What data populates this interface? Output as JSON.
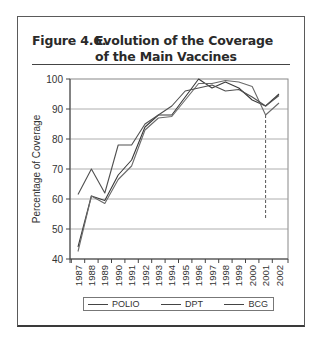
{
  "figure": {
    "number_label": "Figure 4.6.",
    "title_line1": "Evolution of the Coverage",
    "title_line2": "of the Main Vaccines"
  },
  "chart_data": {
    "type": "line",
    "xlabel": "",
    "ylabel": "Percentage of Coverage",
    "ylim": [
      40,
      100
    ],
    "yticks": [
      40,
      50,
      60,
      70,
      80,
      90,
      100
    ],
    "grid": true,
    "legend_position": "bottom",
    "x": [
      "1987",
      "1988",
      "1989",
      "1990",
      "1991",
      "1992",
      "1993",
      "1994",
      "1995",
      "1996",
      "1997",
      "1998",
      "1999",
      "2000",
      "2001",
      "2002"
    ],
    "series": [
      {
        "name": "POLIO",
        "color": "#3a3a3a",
        "values": [
          44,
          61,
          59.5,
          68,
          73,
          84,
          88,
          88,
          94,
          100,
          97,
          99,
          97,
          93,
          91,
          95
        ]
      },
      {
        "name": "DPT",
        "color": "#6a6a6a",
        "values": [
          42.5,
          61,
          58.5,
          66.5,
          71,
          83,
          87,
          87.5,
          93,
          98.5,
          98.5,
          99.5,
          99,
          97.5,
          88,
          92
        ]
      },
      {
        "name": "BCG",
        "color": "#505050",
        "values": [
          61.5,
          70,
          62,
          78,
          78,
          85,
          88,
          91,
          96,
          97,
          98,
          96,
          96.5,
          94,
          91,
          94.5
        ]
      }
    ],
    "annotations": [
      {
        "type": "dashed-vertical-line",
        "x": "2001",
        "from": 88,
        "to": 53
      }
    ]
  }
}
